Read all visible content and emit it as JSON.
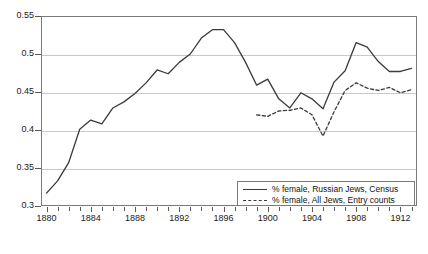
{
  "chart_data": {
    "type": "line",
    "title": "",
    "xlabel": "",
    "ylabel": "",
    "xlim": [
      1879.5,
      1913.5
    ],
    "ylim": [
      0.3,
      0.55
    ],
    "grid": true,
    "legend_position": "bottom-right inside plot",
    "y_ticks": [
      0.3,
      0.35,
      0.4,
      0.45,
      0.5,
      0.55
    ],
    "y_tick_labels": [
      "0.3",
      "0.35",
      "0.4",
      "0.45",
      "0.5",
      "0.55"
    ],
    "x_ticks": [
      1880,
      1881,
      1882,
      1883,
      1884,
      1885,
      1886,
      1887,
      1888,
      1889,
      1890,
      1891,
      1892,
      1893,
      1894,
      1895,
      1896,
      1897,
      1898,
      1899,
      1900,
      1901,
      1902,
      1903,
      1904,
      1905,
      1906,
      1907,
      1908,
      1909,
      1910,
      1911,
      1912,
      1913
    ],
    "x_tick_labels": [
      {
        "value": 1880,
        "label": "1880"
      },
      {
        "value": 1884,
        "label": "1884"
      },
      {
        "value": 1888,
        "label": "1888"
      },
      {
        "value": 1892,
        "label": "1892"
      },
      {
        "value": 1896,
        "label": "1896"
      },
      {
        "value": 1900,
        "label": "1900"
      },
      {
        "value": 1904,
        "label": "1904"
      },
      {
        "value": 1908,
        "label": "1908"
      },
      {
        "value": 1912,
        "label": "1912"
      }
    ],
    "series": [
      {
        "name": "% female, Russian Jews, Census",
        "style": "solid",
        "color": "#3a3a3a",
        "x": [
          1880,
          1881,
          1882,
          1883,
          1884,
          1885,
          1886,
          1887,
          1888,
          1889,
          1890,
          1891,
          1892,
          1893,
          1894,
          1895,
          1896,
          1897,
          1898,
          1899,
          1900,
          1901,
          1902,
          1903,
          1904,
          1905,
          1906,
          1907,
          1908,
          1909,
          1910,
          1911,
          1912,
          1913
        ],
        "values": [
          0.317,
          0.333,
          0.357,
          0.401,
          0.413,
          0.408,
          0.429,
          0.437,
          0.448,
          0.462,
          0.479,
          0.474,
          0.489,
          0.5,
          0.521,
          0.532,
          0.532,
          0.515,
          0.489,
          0.459,
          0.467,
          0.441,
          0.429,
          0.449,
          0.441,
          0.428,
          0.463,
          0.478,
          0.515,
          0.509,
          0.49,
          0.477,
          0.477,
          0.481
        ],
        "note": "Full-range solid series; rises sharply 1880-1886, peaks on a short plateau at ~0.532 in 1895-1896, declines into the late 1890s, oscillates near 0.43-0.47, rises to a second peak ~0.515 in 1908, then flattens near 0.478"
      },
      {
        "name": "% female, All Jews, Entry counts",
        "style": "dashed",
        "color": "#3a3a3a",
        "x": [
          1899,
          1900,
          1901,
          1902,
          1903,
          1904,
          1905,
          1906,
          1907,
          1908,
          1909,
          1910,
          1911,
          1912,
          1913
        ],
        "values": [
          0.42,
          0.418,
          0.425,
          0.426,
          0.429,
          0.42,
          0.392,
          0.424,
          0.452,
          0.462,
          0.455,
          0.452,
          0.456,
          0.449,
          0.453
        ],
        "note": "Dashed series begins 1899 at ~0.42, dips to a minimum ~0.392 in 1905, climbs to ~0.462 by 1908, then stays near 0.45"
      }
    ]
  },
  "legend": {
    "items": [
      {
        "label": "% female, Russian Jews, Census",
        "style": "solid"
      },
      {
        "label": "% female, All Jews, Entry counts",
        "style": "dashed"
      }
    ]
  }
}
